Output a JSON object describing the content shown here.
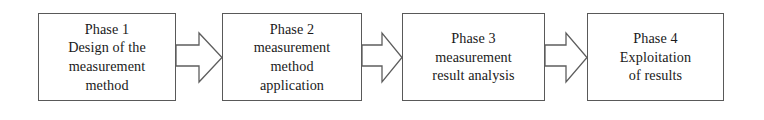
{
  "diagram": {
    "type": "process-flow",
    "orientation": "horizontal",
    "background_color": "#ffffff",
    "box_border_color": "#595959",
    "arrow_stroke_color": "#5d5d5d",
    "arrow_fill_color": "#ffffff",
    "text_color": "#1a1a1a",
    "steps": [
      {
        "id": "phase-1",
        "lines": [
          "Phase 1",
          "Design of the",
          "measurement",
          "method"
        ],
        "x": 38,
        "y": 13,
        "width": 138,
        "height": 88
      },
      {
        "id": "phase-2",
        "lines": [
          "Phase 2",
          "measurement",
          "method",
          "application"
        ],
        "x": 222,
        "y": 13,
        "width": 140,
        "height": 88
      },
      {
        "id": "phase-3",
        "lines": [
          "Phase 3",
          "measurement",
          "result analysis"
        ],
        "x": 402,
        "y": 13,
        "width": 143,
        "height": 88
      },
      {
        "id": "phase-4",
        "lines": [
          "Phase 4",
          "Exploitation",
          "of results"
        ],
        "x": 587,
        "y": 13,
        "width": 137,
        "height": 88
      }
    ],
    "connectors": [
      {
        "id": "arrow-1",
        "from": "phase-1",
        "to": "phase-2",
        "shape": "block-arrow-right",
        "x1": 176,
        "x2": 222
      },
      {
        "id": "arrow-2",
        "from": "phase-2",
        "to": "phase-3",
        "shape": "block-arrow-right",
        "x1": 362,
        "x2": 402
      },
      {
        "id": "arrow-3",
        "from": "phase-3",
        "to": "phase-4",
        "shape": "block-arrow-right",
        "x1": 545,
        "x2": 587
      }
    ]
  }
}
